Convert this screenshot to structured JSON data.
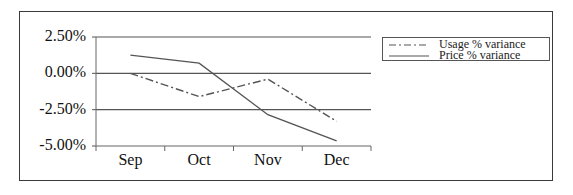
{
  "chart_data": {
    "type": "line",
    "title": "",
    "xlabel": "",
    "ylabel": "",
    "categories": [
      "Sep",
      "Oct",
      "Nov",
      "Dec"
    ],
    "y_tick_labels": [
      "2.50%",
      "0.00%",
      "-2.50%",
      "-5.00%"
    ],
    "y_ticks": [
      2.5,
      0.0,
      -2.5,
      -5.0
    ],
    "ylim": [
      -5.0,
      2.5
    ],
    "grid": "horizontal major gridlines",
    "legend_position": "right",
    "series": [
      {
        "name": "Usage % variance",
        "style": "dash-dot",
        "color": "#555555",
        "values": [
          0.0,
          -1.6,
          -0.4,
          -3.3
        ]
      },
      {
        "name": "Price % variance",
        "style": "solid",
        "color": "#555555",
        "values": [
          1.25,
          0.7,
          -2.85,
          -4.65
        ]
      }
    ]
  }
}
